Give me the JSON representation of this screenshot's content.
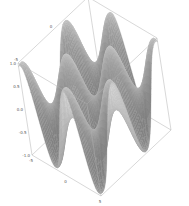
{
  "chart_data": {
    "type": "surface3d",
    "title": "",
    "function": "z = sin(x) * sin(y)",
    "x_range": [
      -5,
      5
    ],
    "y_range": [
      -5,
      5
    ],
    "z_range": [
      -1.0,
      1.0
    ],
    "xlabel": "",
    "ylabel": "",
    "zlabel": "",
    "x_ticks": [
      "-5",
      "0",
      "5"
    ],
    "y_ticks": [
      "-5",
      "0",
      "5"
    ],
    "z_ticks": [
      "1.0",
      "0.5",
      "0.0",
      "-0.5",
      "-1.0"
    ],
    "x_tick_values": [
      -5,
      0,
      5
    ],
    "y_tick_values": [
      -5,
      0,
      5
    ],
    "z_tick_values": [
      1.0,
      0.5,
      0.0,
      -0.5,
      -1.0
    ],
    "colormap": "gray",
    "grid": false,
    "legend": "none"
  }
}
